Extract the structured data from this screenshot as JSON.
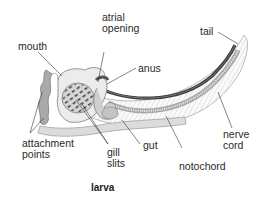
{
  "diagram": {
    "caption": "larva",
    "labels": {
      "mouth": "mouth",
      "atrial_opening_1": "atrial",
      "atrial_opening_2": "opening",
      "anus": "anus",
      "tail": "tail",
      "nerve_cord_1": "nerve",
      "nerve_cord_2": "cord",
      "notochord": "notochord",
      "gut": "gut",
      "gill_slits_1": "gill",
      "gill_slits_2": "slits",
      "attachment_points_1": "attachment",
      "attachment_points_2": "points"
    },
    "colors": {
      "body_fill": "#e6e6e6",
      "outline": "#8a8a8a",
      "nerve_cord": "#3a3a3a",
      "notochord": "#9a9a9a",
      "gut": "#c8c8c8",
      "pointer_line": "#333333"
    }
  }
}
